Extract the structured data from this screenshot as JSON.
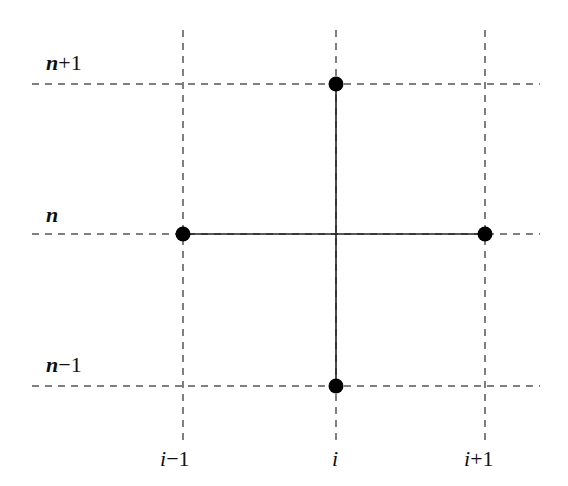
{
  "diagram": {
    "type": "finite-difference-stencil",
    "row_labels": [
      {
        "var": "n",
        "op": "+",
        "num": "1",
        "text": "n+1"
      },
      {
        "var": "n",
        "op": "",
        "num": "",
        "text": "n"
      },
      {
        "var": "n",
        "op": "−",
        "num": "1",
        "text": "n−1"
      }
    ],
    "column_labels": [
      {
        "var": "i",
        "op": "−",
        "num": "1",
        "text": "i−1"
      },
      {
        "var": "i",
        "op": "",
        "num": "",
        "text": "i"
      },
      {
        "var": "i",
        "op": "+",
        "num": "1",
        "text": "i+1"
      }
    ],
    "grid": {
      "columns_x": [
        183,
        336,
        485
      ],
      "rows_y": [
        84,
        234,
        386
      ],
      "line_style": "dashed",
      "line_color": "#555555"
    },
    "nodes": [
      {
        "label": "(i, n+1)",
        "x": 336,
        "y": 84
      },
      {
        "label": "(i-1, n)",
        "x": 183,
        "y": 234
      },
      {
        "label": "(i+1, n)",
        "x": 485,
        "y": 234
      },
      {
        "label": "(i, n-1)",
        "x": 336,
        "y": 386
      }
    ],
    "node_color": "#000000",
    "connectors": [
      {
        "from": "(i-1, n)",
        "to": "(i+1, n)",
        "style": "solid"
      },
      {
        "from": "(i, n+1)",
        "to": "(i, n-1)",
        "style": "solid"
      }
    ]
  }
}
